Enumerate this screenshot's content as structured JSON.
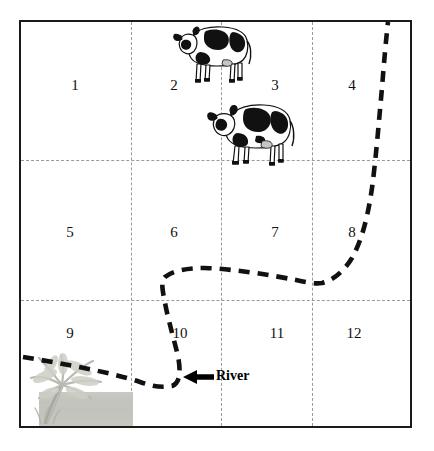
{
  "figure": {
    "kind": "map-diagram"
  },
  "field": {
    "columns": 4,
    "rows": 3,
    "cells": [
      {
        "id": 1,
        "label": "1",
        "x": 75,
        "y": 78
      },
      {
        "id": 2,
        "label": "2",
        "x": 174,
        "y": 78
      },
      {
        "id": 3,
        "label": "3",
        "x": 275,
        "y": 78
      },
      {
        "id": 4,
        "label": "4",
        "x": 352,
        "y": 78
      },
      {
        "id": 5,
        "label": "5",
        "x": 70,
        "y": 225
      },
      {
        "id": 6,
        "label": "6",
        "x": 174,
        "y": 225
      },
      {
        "id": 7,
        "label": "7",
        "x": 275,
        "y": 225
      },
      {
        "id": 8,
        "label": "8",
        "x": 352,
        "y": 225
      },
      {
        "id": 9,
        "label": "9",
        "x": 70,
        "y": 326
      },
      {
        "id": 10,
        "label": "10",
        "x": 180,
        "y": 326
      },
      {
        "id": 11,
        "label": "11",
        "x": 277,
        "y": 326
      },
      {
        "id": 12,
        "label": "12",
        "x": 354,
        "y": 326
      }
    ],
    "grid_lines_vertical": [
      131,
      221,
      312
    ],
    "grid_lines_horizontal": [
      160,
      300
    ],
    "border_color": "#1a1a1a",
    "grid_color": "#9a9a9a"
  },
  "livestock": [
    {
      "name": "cow-upper",
      "x": 173,
      "y": 14,
      "width": 82,
      "height": 72
    },
    {
      "name": "cow-lower",
      "x": 207,
      "y": 92,
      "width": 90,
      "height": 76
    }
  ],
  "scenery": {
    "tree": {
      "name": "palm-tree",
      "x": 21,
      "y": 352
    }
  },
  "river": {
    "label": "River",
    "label_x": 216,
    "label_y": 369,
    "stroke_color": "#000000",
    "style": "dashed"
  }
}
